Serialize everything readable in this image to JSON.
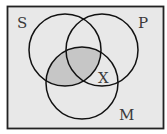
{
  "diagram": {
    "type": "venn",
    "sets": [
      {
        "id": "S",
        "label": "S",
        "cx": 65,
        "cy": 50,
        "r": 36
      },
      {
        "id": "P",
        "label": "P",
        "cx": 102,
        "cy": 50,
        "r": 36
      },
      {
        "id": "M",
        "label": "M",
        "cx": 82,
        "cy": 83,
        "r": 36
      }
    ],
    "shaded_region": "S ∩ M",
    "marker": {
      "label": "X",
      "region": "P ∩ M − S"
    },
    "colors": {
      "background": "#e8e8e8",
      "shading": "#c6c6c6",
      "stroke": "#111111",
      "page": "#ffffff"
    }
  },
  "labels": {
    "s": "S",
    "p": "P",
    "m": "M",
    "x": "X"
  }
}
